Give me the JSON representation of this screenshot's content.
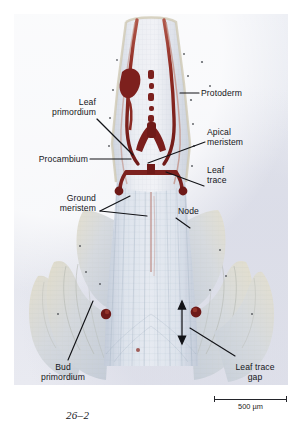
{
  "figure": {
    "number": "26–2",
    "plate_background": "#e7e8ef",
    "stain_colors": {
      "vascular_dark_red": "#7e1f1d",
      "vascular_mid_red": "#a8433a",
      "vascular_light_red": "#c98b7e",
      "tissue_pale_blue": "#ccd3de",
      "tissue_lighter": "#dfe4ec",
      "leaf_cream": "#ded9c8",
      "cell_line": "#9aa7b8"
    }
  },
  "labels": [
    {
      "id": "protoderm",
      "text": "Protoderm",
      "align": "l"
    },
    {
      "id": "leaf-primordium",
      "text": "Leaf\nprimordium",
      "align": "r"
    },
    {
      "id": "apical-meristem",
      "text": "Apical\nmeristem",
      "align": "l"
    },
    {
      "id": "procambium",
      "text": "Procambium",
      "align": "r"
    },
    {
      "id": "leaf-trace",
      "text": "Leaf\ntrace",
      "align": "l"
    },
    {
      "id": "ground-meristem",
      "text": "Ground\nmeristem",
      "align": "r"
    },
    {
      "id": "node",
      "text": "Node",
      "align": "l"
    },
    {
      "id": "bud-primordium",
      "text": "Bud\nprimordium",
      "align": "c"
    },
    {
      "id": "leaf-trace-gap",
      "text": "Leaf trace\ngap",
      "align": "c"
    }
  ],
  "scale_bar": {
    "value": "500",
    "unit": "µm",
    "text": "500 µm"
  }
}
